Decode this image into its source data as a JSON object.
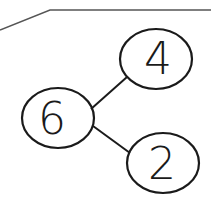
{
  "diagram": {
    "type": "number-bond",
    "whole": {
      "label": "6"
    },
    "parts": [
      {
        "label": "4"
      },
      {
        "label": "2"
      }
    ],
    "colors": {
      "stroke": "#1a1a1a",
      "background": "#ffffff"
    }
  }
}
